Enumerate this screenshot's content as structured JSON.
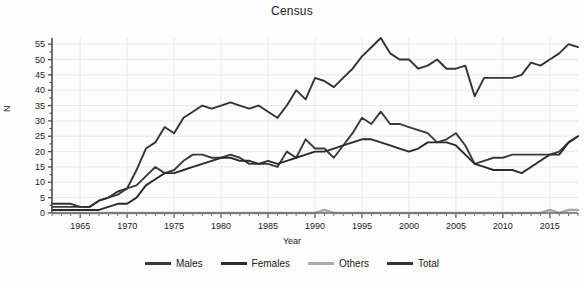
{
  "chart_data": {
    "type": "line",
    "title": "Census",
    "xlabel": "Year",
    "ylabel": "N",
    "grid": true,
    "legend_position": "bottom",
    "xlim": [
      1962,
      2018
    ],
    "ylim": [
      0,
      57
    ],
    "yticks": [
      0,
      5,
      10,
      15,
      20,
      25,
      30,
      35,
      40,
      45,
      50,
      55
    ],
    "xticks": [
      1965,
      1970,
      1975,
      1980,
      1985,
      1990,
      1995,
      2000,
      2005,
      2010,
      2015
    ],
    "xtick_labels": [
      "1965",
      "1970",
      "1975",
      "1980",
      "1985",
      "1990",
      "1995",
      "2000",
      "2005",
      "2010",
      "2015"
    ],
    "ytick_labels": [
      "0",
      "5",
      "10",
      "15",
      "20",
      "25",
      "30",
      "35",
      "40",
      "45",
      "50",
      "55"
    ],
    "minor_xticks_interval": 1,
    "x": [
      1962,
      1963,
      1964,
      1965,
      1966,
      1967,
      1968,
      1969,
      1970,
      1971,
      1972,
      1973,
      1974,
      1975,
      1976,
      1977,
      1978,
      1979,
      1980,
      1981,
      1982,
      1983,
      1984,
      1985,
      1986,
      1987,
      1988,
      1989,
      1990,
      1991,
      1992,
      1993,
      1994,
      1995,
      1996,
      1997,
      1998,
      1999,
      2000,
      2001,
      2002,
      2003,
      2004,
      2005,
      2006,
      2007,
      2008,
      2009,
      2010,
      2011,
      2012,
      2013,
      2014,
      2015,
      2016,
      2017,
      2018
    ],
    "series": [
      {
        "name": "Males",
        "color": "#3a3a3a",
        "values": [
          2,
          2,
          2,
          2,
          2,
          4,
          5,
          6,
          8,
          9,
          12,
          15,
          13,
          14,
          17,
          19,
          19,
          18,
          18,
          19,
          18,
          16,
          16,
          16,
          15,
          20,
          18,
          24,
          21,
          21,
          18,
          22,
          26,
          31,
          29,
          33,
          29,
          29,
          28,
          27,
          26,
          23,
          24,
          26,
          22,
          16,
          17,
          18,
          18,
          19,
          19,
          19,
          19,
          19,
          20,
          23,
          25
        ]
      },
      {
        "name": "Females",
        "color": "#2b2b2b",
        "values": [
          1,
          1,
          1,
          1,
          1,
          1,
          2,
          3,
          3,
          5,
          9,
          11,
          13,
          13,
          14,
          15,
          16,
          17,
          18,
          18,
          17,
          17,
          16,
          17,
          16,
          17,
          18,
          19,
          20,
          20,
          21,
          22,
          23,
          24,
          24,
          23,
          22,
          21,
          20,
          21,
          23,
          23,
          23,
          22,
          19,
          16,
          15,
          14,
          14,
          14,
          13,
          15,
          17,
          19,
          19,
          23,
          25
        ]
      },
      {
        "name": "Others",
        "color": "#aaaaaa",
        "values": [
          0,
          0,
          0,
          0,
          0,
          0,
          0,
          0,
          0,
          0,
          0,
          0,
          0,
          0,
          0,
          0,
          0,
          0,
          0,
          0,
          0,
          0,
          0,
          0,
          0,
          0,
          0,
          0,
          0,
          1,
          0,
          0,
          0,
          0,
          0,
          0,
          0,
          0,
          0,
          0,
          0,
          0,
          0,
          0,
          0,
          0,
          0,
          0,
          0,
          0,
          0,
          0,
          0,
          1,
          0,
          1,
          1
        ]
      },
      {
        "name": "Total",
        "color": "#333333",
        "values": [
          3,
          3,
          3,
          2,
          2,
          4,
          5,
          7,
          8,
          14,
          21,
          23,
          28,
          26,
          31,
          33,
          35,
          34,
          35,
          36,
          35,
          34,
          35,
          33,
          31,
          35,
          40,
          37,
          44,
          43,
          41,
          44,
          47,
          51,
          54,
          57,
          52,
          50,
          50,
          47,
          48,
          50,
          47,
          47,
          48,
          38,
          44,
          44,
          44,
          44,
          45,
          49,
          48,
          50,
          52,
          55,
          54
        ]
      }
    ]
  },
  "legend": {
    "entries": [
      {
        "label": "Males",
        "color": "#3a3a3a"
      },
      {
        "label": "Females",
        "color": "#2b2b2b"
      },
      {
        "label": "Others",
        "color": "#aaaaaa"
      },
      {
        "label": "Total",
        "color": "#333333"
      }
    ]
  }
}
